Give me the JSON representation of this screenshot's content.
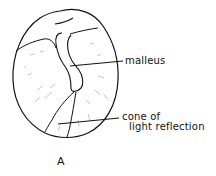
{
  "figure": {
    "panel_label": "A",
    "labels": {
      "malleus": "malleus",
      "cone_line1": "cone of",
      "cone_line2": "light reflection"
    },
    "colors": {
      "ink": "#111111",
      "background": "#ffffff",
      "texture": "#9a9a9a"
    }
  }
}
